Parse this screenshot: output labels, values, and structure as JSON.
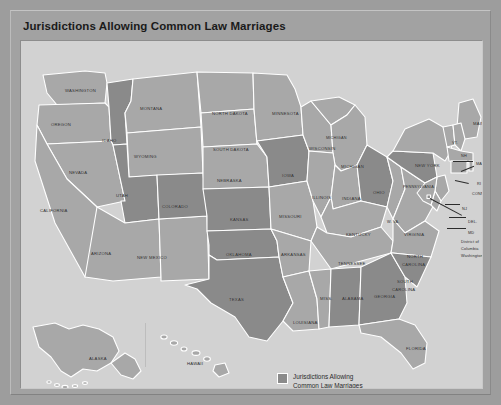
{
  "figure": {
    "title": "Jurisdictions Allowing Common Law Marriages",
    "frame_color": "#9d9d9d",
    "map_background": "#d2d2d2",
    "state_plain_color": "#a8a8a8",
    "state_highlight_color": "#8a8a8a",
    "border_color": "#ffffff"
  },
  "legend": {
    "swatch_color": "#8a8a8a",
    "line1": "Jurisdictions Allowing",
    "line2": "Common Law Marriages"
  },
  "map": {
    "highlighted_states": [
      "Idaho",
      "Utah",
      "Colorado",
      "Kansas",
      "Iowa",
      "Oklahoma",
      "Texas",
      "Ohio",
      "Pennsylvania",
      "Georgia",
      "South Carolina",
      "Alabama",
      "District of Columbia"
    ],
    "labels": [
      {
        "name": "washington",
        "text": "WASHINGTON",
        "x": 44,
        "y": 48,
        "size": "s7"
      },
      {
        "name": "oregon",
        "text": "OREGON",
        "x": 30,
        "y": 82,
        "size": "s7"
      },
      {
        "name": "idaho",
        "text": "IDAHO",
        "x": 81,
        "y": 98,
        "size": "s7"
      },
      {
        "name": "montana",
        "text": "MONTANA",
        "x": 119,
        "y": 66,
        "size": "s7"
      },
      {
        "name": "wyoming",
        "text": "WYOMING",
        "x": 113,
        "y": 114,
        "size": "s7"
      },
      {
        "name": "nevada",
        "text": "NEVADA",
        "x": 48,
        "y": 130,
        "size": "s7"
      },
      {
        "name": "california",
        "text": "CALIFORNIA",
        "x": 19,
        "y": 168,
        "size": "s7"
      },
      {
        "name": "utah",
        "text": "UTAH",
        "x": 95,
        "y": 153,
        "size": "s7"
      },
      {
        "name": "arizona",
        "text": "ARIZONA",
        "x": 70,
        "y": 211,
        "size": "s7"
      },
      {
        "name": "new-mexico",
        "text": "NEW MEXICO",
        "x": 116,
        "y": 215,
        "size": "s7"
      },
      {
        "name": "colorado",
        "text": "COLORADO",
        "x": 141,
        "y": 164,
        "size": "s7"
      },
      {
        "name": "north-dakota",
        "text": "NORTH DAKOTA",
        "x": 191,
        "y": 71,
        "size": "s7"
      },
      {
        "name": "south-dakota",
        "text": "SOUTH DAKOTA",
        "x": 192,
        "y": 107,
        "size": "s7"
      },
      {
        "name": "nebraska",
        "text": "NEBRASKA",
        "x": 196,
        "y": 138,
        "size": "s7"
      },
      {
        "name": "kansas",
        "text": "KANSAS",
        "x": 209,
        "y": 177,
        "size": "s7"
      },
      {
        "name": "oklahoma",
        "text": "OKLAHOMA",
        "x": 205,
        "y": 212,
        "size": "s7"
      },
      {
        "name": "texas",
        "text": "TEXAS",
        "x": 208,
        "y": 257,
        "size": "s7"
      },
      {
        "name": "minnesota",
        "text": "MINNESOTA",
        "x": 251,
        "y": 71,
        "size": "s7"
      },
      {
        "name": "iowa",
        "text": "IOWA",
        "x": 261,
        "y": 133,
        "size": "s7"
      },
      {
        "name": "missouri",
        "text": "MISSOURI",
        "x": 258,
        "y": 174,
        "size": "s7"
      },
      {
        "name": "arkansas",
        "text": "ARKANSAS",
        "x": 260,
        "y": 212,
        "size": "s7"
      },
      {
        "name": "louisiana",
        "text": "LOUISIANA",
        "x": 272,
        "y": 280,
        "size": "s7"
      },
      {
        "name": "mississippi",
        "text": "MISS.",
        "x": 299,
        "y": 256,
        "size": "s7"
      },
      {
        "name": "wisconsin",
        "text": "WISCONSIN",
        "x": 288,
        "y": 106,
        "size": "s7"
      },
      {
        "name": "michigan-up",
        "text": "MICHIGAN",
        "x": 305,
        "y": 96,
        "size": "s6"
      },
      {
        "name": "michigan",
        "text": "MICHIGAN",
        "x": 320,
        "y": 124,
        "size": "s7"
      },
      {
        "name": "illinois",
        "text": "ILLINOIS",
        "x": 291,
        "y": 155,
        "size": "s7"
      },
      {
        "name": "indiana",
        "text": "INDIANA",
        "x": 321,
        "y": 156,
        "size": "s7"
      },
      {
        "name": "ohio",
        "text": "OHIO",
        "x": 352,
        "y": 150,
        "size": "s7"
      },
      {
        "name": "kentucky",
        "text": "KENTUCKY",
        "x": 325,
        "y": 192,
        "size": "s7"
      },
      {
        "name": "tennessee",
        "text": "TENNESSEE",
        "x": 317,
        "y": 221,
        "size": "s7"
      },
      {
        "name": "alabama",
        "text": "ALABAMA",
        "x": 321,
        "y": 256,
        "size": "s7"
      },
      {
        "name": "georgia",
        "text": "GEORGIA",
        "x": 353,
        "y": 254,
        "size": "s7"
      },
      {
        "name": "west-virginia",
        "text": "W. VA.",
        "x": 366,
        "y": 180,
        "size": "s6"
      },
      {
        "name": "virginia",
        "text": "VIRGINIA",
        "x": 383,
        "y": 192,
        "size": "s7"
      },
      {
        "name": "north-carolina-1",
        "text": "NORTH",
        "x": 386,
        "y": 214,
        "size": "s7"
      },
      {
        "name": "north-carolina-2",
        "text": "CAROLINA",
        "x": 381,
        "y": 222,
        "size": "s7"
      },
      {
        "name": "south-carolina-1",
        "text": "SOUTH",
        "x": 376,
        "y": 239,
        "size": "s7"
      },
      {
        "name": "south-carolina-2",
        "text": "CAROLINA",
        "x": 371,
        "y": 247,
        "size": "s7"
      },
      {
        "name": "florida",
        "text": "FLORIDA",
        "x": 385,
        "y": 306,
        "size": "s7"
      },
      {
        "name": "pennsylvania",
        "text": "PENNSYLVANIA",
        "x": 382,
        "y": 145,
        "size": "s6"
      },
      {
        "name": "new-york",
        "text": "NEW YORK",
        "x": 394,
        "y": 123,
        "size": "s7"
      },
      {
        "name": "maine",
        "text": "MAINE",
        "x": 452,
        "y": 81,
        "size": "s7"
      },
      {
        "name": "vermont",
        "text": "VT.",
        "x": 431,
        "y": 101,
        "size": "s6"
      },
      {
        "name": "new-hampshire",
        "text": "NH",
        "x": 440,
        "y": 114,
        "size": "s6"
      },
      {
        "name": "massachusetts",
        "text": "MASS.",
        "x": 455,
        "y": 122,
        "size": "s6"
      },
      {
        "name": "rhode-island",
        "text": "RI",
        "x": 456,
        "y": 142,
        "size": "s6"
      },
      {
        "name": "connecticut",
        "text": "CONN.",
        "x": 451,
        "y": 152,
        "size": "s6"
      },
      {
        "name": "new-jersey",
        "text": "NJ",
        "x": 441,
        "y": 167,
        "size": "s6"
      },
      {
        "name": "delaware",
        "text": "DEL.",
        "x": 447,
        "y": 180,
        "size": "s6"
      },
      {
        "name": "maryland",
        "text": "MD",
        "x": 447,
        "y": 191,
        "size": "s6"
      },
      {
        "name": "dc-1",
        "text": "District of",
        "x": 440,
        "y": 200,
        "size": "s6"
      },
      {
        "name": "dc-2",
        "text": "Columbia",
        "x": 440,
        "y": 207,
        "size": "s6"
      },
      {
        "name": "dc-3",
        "text": "Washington D.C.",
        "x": 440,
        "y": 214,
        "size": "s6"
      },
      {
        "name": "alaska",
        "text": "ALASKA",
        "x": 68,
        "y": 316,
        "size": "s7"
      },
      {
        "name": "hawaii",
        "text": "HAWAII",
        "x": 166,
        "y": 321,
        "size": "s7"
      }
    ]
  }
}
